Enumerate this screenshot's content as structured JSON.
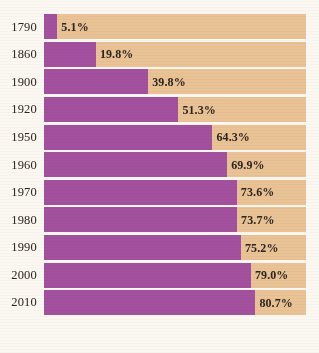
{
  "chart_data": {
    "type": "bar",
    "orientation": "horizontal",
    "title": "",
    "subtitle": "",
    "xlabel": "",
    "ylabel": "",
    "xlim": [
      0,
      100
    ],
    "grid": false,
    "legend": "none",
    "value_suffix": "%",
    "categories": [
      "1790",
      "1860",
      "1900",
      "1920",
      "1950",
      "1960",
      "1970",
      "1980",
      "1990",
      "2000",
      "2010"
    ],
    "values": [
      5.1,
      19.8,
      39.8,
      51.3,
      64.3,
      69.9,
      73.6,
      73.7,
      75.2,
      79.0,
      80.7
    ],
    "series": [
      {
        "name": "Percent",
        "values": [
          5.1,
          19.8,
          39.8,
          51.3,
          64.3,
          69.9,
          73.6,
          73.7,
          75.2,
          79.0,
          80.7
        ]
      }
    ],
    "rows": [
      {
        "year": "1790",
        "value": 5.1,
        "label": "5.1%"
      },
      {
        "year": "1860",
        "value": 19.8,
        "label": "19.8%"
      },
      {
        "year": "1900",
        "value": 39.8,
        "label": "39.8%"
      },
      {
        "year": "1920",
        "value": 51.3,
        "label": "51.3%"
      },
      {
        "year": "1950",
        "value": 64.3,
        "label": "64.3%"
      },
      {
        "year": "1960",
        "value": 69.9,
        "label": "69.9%"
      },
      {
        "year": "1970",
        "value": 73.6,
        "label": "73.6%"
      },
      {
        "year": "1980",
        "value": 73.7,
        "label": "73.7%"
      },
      {
        "year": "1990",
        "value": 75.2,
        "label": "75.2%"
      },
      {
        "year": "2000",
        "value": 79.0,
        "label": "79.0%"
      },
      {
        "year": "2010",
        "value": 80.7,
        "label": "80.7%"
      }
    ]
  },
  "colors": {
    "fill": "#a3519f",
    "track": "#e9c295",
    "background": "#fbf8f2",
    "text": "#2b2520"
  }
}
